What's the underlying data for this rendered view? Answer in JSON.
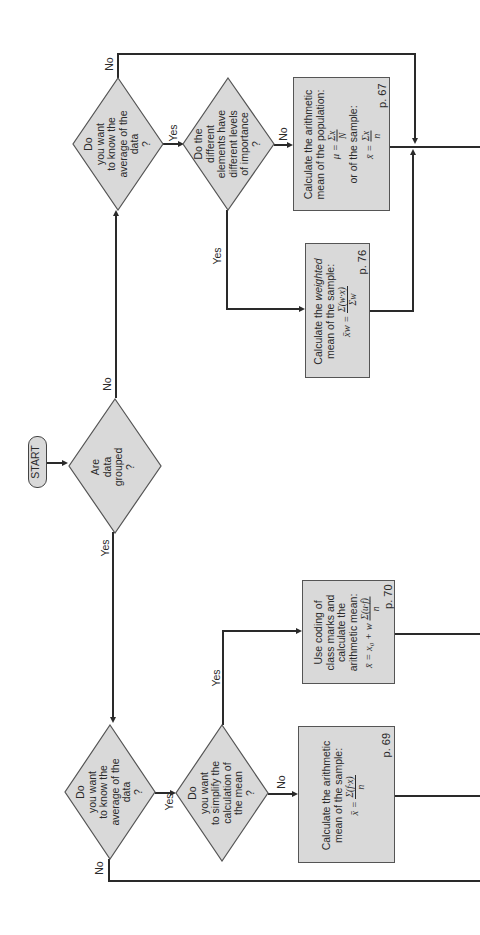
{
  "diagram": {
    "orientation": "rotated -90deg (text reads bottom-to-top)",
    "fill_color": "#d9d9d9",
    "stroke_color": "#2a2a2a",
    "start": {
      "label": "START"
    },
    "decision_grouped": {
      "text": "Are\ndata\ngrouped\n?",
      "yes_label": "Yes",
      "no_label": "No"
    },
    "ungrouped_branch": {
      "decision_average": {
        "text": "Do\nyou want\nto know the\naverage of the\ndata\n?",
        "yes_label": "Yes",
        "no_label": "No"
      },
      "decision_importance": {
        "text": "Do the\ndifferent\nelements have\ndifferent levels\nof importance\n?",
        "yes_label": "Yes",
        "no_label": "No"
      },
      "box_arithmetic": {
        "text": "Calculate the arithmetic\nmean of the population:",
        "formula_pop_lhs": "μ =",
        "formula_pop_num": "Σx",
        "formula_pop_den": "N",
        "middle_text": "or of the sample:",
        "formula_sample_lhs": "x̄ =",
        "formula_sample_num": "Σx",
        "formula_sample_den": "n",
        "page": "p. 67"
      },
      "box_weighted": {
        "text_pre": "Calculate the ",
        "text_em": "weighted",
        "text_post": "\nmean of the sample:",
        "formula_lhs": "x̄w =",
        "formula_num": "Σ(w·x)",
        "formula_den": "Σw",
        "page": "p. 76"
      }
    },
    "grouped_branch": {
      "decision_average": {
        "text": "Do\nyou want\nto know the\naverage of the\ndata\n?",
        "yes_label": "Yes",
        "no_label": "No"
      },
      "decision_simplify": {
        "text": "Do\nyou want\nto simplify the\ncalculation of\nthe mean\n?",
        "yes_label": "Yes",
        "no_label": "No"
      },
      "box_coding": {
        "text": "Use coding of\nclass marks and\ncalculate the\narithmetic mean:",
        "formula_lhs": "x̄ = x₀ + w",
        "formula_num": "Σ(u·f)",
        "formula_den": "n",
        "page": "p. 70"
      },
      "box_grouped_mean": {
        "text": "Calculate the arithmetic\nmean of the sample:",
        "formula_lhs": "x̄ =",
        "formula_num": "Σ(f·x)",
        "formula_den": "n",
        "page": "p. 69"
      }
    }
  }
}
